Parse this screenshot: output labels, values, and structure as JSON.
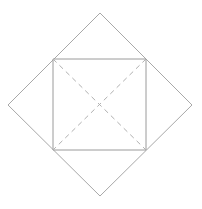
{
  "figure": {
    "type": "geometry-diagram",
    "canvas": {
      "width": 202,
      "height": 209,
      "background": "#ffffff"
    },
    "colors": {
      "outer_diamond_stroke": "#a8a8a8",
      "inner_square_stroke": "#9a9a9a",
      "diagonal_stroke": "#b0b0b0",
      "background": "#ffffff",
      "artifact_text": "#fbfbfb"
    },
    "strokes": {
      "outer_diamond_width": "1",
      "inner_square_width": "1",
      "diagonal_width": "1",
      "diagonal_dash_pattern": "5 4"
    },
    "shapes": {
      "outer_diamond": {
        "name": "outer-diamond",
        "points": "100,13 192,105 100,196 8,105",
        "vertices": [
          {
            "label": "top",
            "x": 100,
            "y": 13
          },
          {
            "label": "right",
            "x": 192,
            "y": 105
          },
          {
            "label": "bottom",
            "x": 100,
            "y": 196
          },
          {
            "label": "left",
            "x": 8,
            "y": 105
          }
        ]
      },
      "inner_square": {
        "name": "inner-square",
        "points": "53,59 146,59 146,150 53,150",
        "vertices": [
          {
            "label": "top-left",
            "x": 53,
            "y": 59
          },
          {
            "label": "top-right",
            "x": 146,
            "y": 59
          },
          {
            "label": "bottom-right",
            "x": 146,
            "y": 150
          },
          {
            "label": "bottom-left",
            "x": 53,
            "y": 150
          }
        ]
      },
      "diagonals": [
        {
          "name": "diagonal-tl-br",
          "x1": 53,
          "y1": 59,
          "x2": 146,
          "y2": 150
        },
        {
          "name": "diagonal-tr-bl",
          "x1": 146,
          "y1": 59,
          "x2": 53,
          "y2": 150
        }
      ],
      "center": {
        "name": "center-point",
        "x": 100,
        "y": 105
      }
    },
    "artifact": {
      "line1": "",
      "line2": ""
    }
  }
}
